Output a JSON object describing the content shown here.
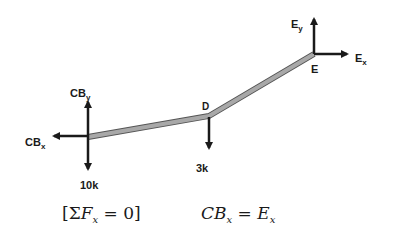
{
  "diagram": {
    "beam": {
      "points": {
        "CB": [
          88,
          137
        ],
        "D": [
          209,
          116
        ],
        "E": [
          314,
          54
        ]
      },
      "fill_color": "#a8a8a8",
      "edge_color": "#555555"
    },
    "arrow_color": "#1a1a1a",
    "labels": {
      "cby": {
        "main": "CB",
        "sub": "y"
      },
      "cbx": {
        "main": "CB",
        "sub": "x"
      },
      "load_10k": "10k",
      "point_d": "D",
      "load_3k": "3k",
      "ey": {
        "main": "E",
        "sub": "y"
      },
      "ex": {
        "main": "E",
        "sub": "x"
      },
      "point_e": "E"
    },
    "equations": {
      "condition": {
        "open": "[",
        "sigma": "Σ",
        "var": "F",
        "sub": "x",
        "rest": " = 0]"
      },
      "result": {
        "lhs": "CB",
        "lhs_sub": "x",
        "eq": " = ",
        "rhs": "E",
        "rhs_sub": "x"
      }
    }
  }
}
